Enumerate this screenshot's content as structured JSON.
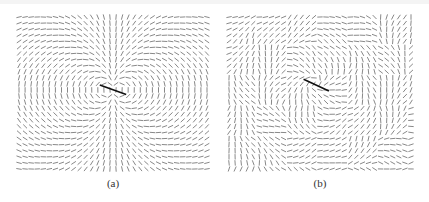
{
  "figure": {
    "panels": [
      {
        "id": "a",
        "caption": "(a)",
        "field_type": "dipole-quadrant",
        "grid": {
          "cols": 32,
          "rows": 26
        },
        "center": [
          0.5,
          0.48
        ],
        "center_arrow_angle_deg": 20,
        "stroke_color": "#555555"
      },
      {
        "id": "b",
        "caption": "(b)",
        "field_type": "swirl-blocky",
        "grid": {
          "cols": 31,
          "rows": 26
        },
        "center": [
          0.48,
          0.45
        ],
        "center_arrow_angle_deg": 25,
        "stroke_color": "#555555"
      }
    ]
  }
}
